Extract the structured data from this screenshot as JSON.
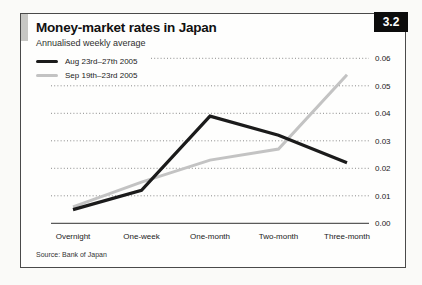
{
  "panel": {
    "title": "Money-market rates in Japan",
    "subtitle": "Annualised weekly average",
    "badge": "3.2",
    "source": "Source: Bank of Japan"
  },
  "chart_data": {
    "type": "line",
    "title": "Money-market rates in Japan",
    "subtitle": "Annualised weekly average",
    "categories": [
      "Overnight",
      "One-week",
      "One-month",
      "Two-month",
      "Three-month"
    ],
    "series": [
      {
        "name": "Aug 23rd–27th 2005",
        "color": "#1b1b1b",
        "width": 3.2,
        "values": [
          0.005,
          0.012,
          0.039,
          0.032,
          0.022
        ]
      },
      {
        "name": "Sep 19th–23rd 2005",
        "color": "#c3c3c3",
        "width": 3.0,
        "values": [
          0.006,
          0.015,
          0.023,
          0.027,
          0.054
        ]
      }
    ],
    "ylim": [
      0,
      0.06
    ],
    "yticks": [
      "0.06",
      "0.05",
      "0.04",
      "0.03",
      "0.02",
      "0.01",
      "0.00"
    ],
    "yaxis_side": "right",
    "grid": "dotted-horizontal",
    "grid_color": "#8a8a8a",
    "axis_color": "#5a5a5a",
    "legend_position": "top-left",
    "source": "Source: Bank of Japan"
  }
}
